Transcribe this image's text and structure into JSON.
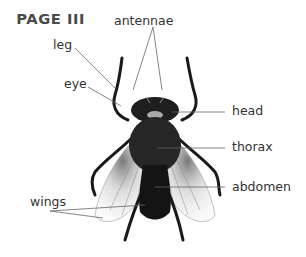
{
  "title": "PAGE III",
  "labels": {
    "antennae": "antennae",
    "leg": "leg",
    "eye": "eye",
    "head": "head",
    "thorax": "thorax",
    "abdomen": "abdomen",
    "wings": "wings"
  }
}
